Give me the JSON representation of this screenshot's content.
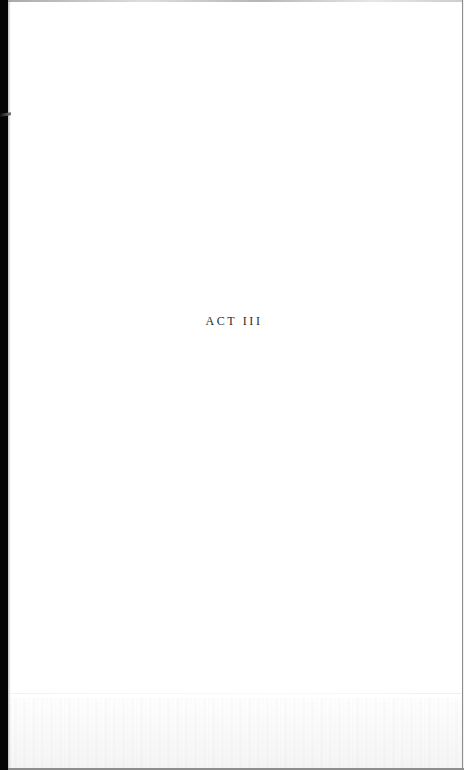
{
  "page": {
    "heading": "ACT III"
  },
  "colors": {
    "paper": "#ffffff",
    "binding_edge": "#050505",
    "text": "#2a2a2a",
    "border": "#8c8c8c"
  }
}
